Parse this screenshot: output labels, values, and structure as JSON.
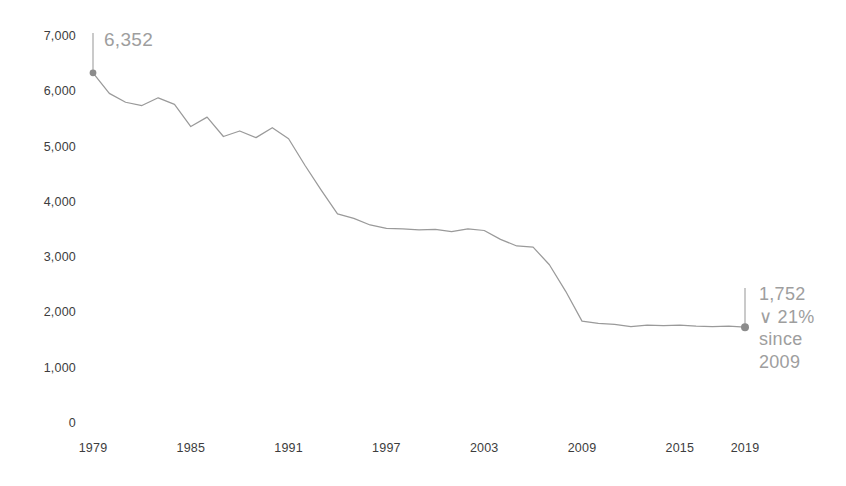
{
  "chart_data": {
    "type": "line",
    "title": "",
    "subtitle": "",
    "xlabel": "",
    "ylabel": "",
    "xlim": [
      1979,
      2019
    ],
    "ylim": [
      0,
      7000
    ],
    "grid": false,
    "legend": false,
    "legend_position": "none",
    "line_color": "#9a9a9a",
    "marker_color": "#8c8c8c",
    "annotation_color": "#9e9e9e",
    "tick_color": "#3d3d3d",
    "x_ticks": [
      "1979",
      "1985",
      "1991",
      "1997",
      "2003",
      "2009",
      "2015",
      "2019"
    ],
    "x_tick_values": [
      1979,
      1985,
      1991,
      1997,
      2003,
      2009,
      2015,
      2019
    ],
    "y_ticks": [
      "0",
      "1,000",
      "2,000",
      "3,000",
      "4,000",
      "5,000",
      "6,000",
      "7,000"
    ],
    "y_tick_values": [
      0,
      1000,
      2000,
      3000,
      4000,
      5000,
      6000,
      7000
    ],
    "x": [
      1979,
      1980,
      1981,
      1982,
      1983,
      1984,
      1985,
      1986,
      1987,
      1988,
      1989,
      1990,
      1991,
      1992,
      1993,
      1994,
      1995,
      1996,
      1997,
      1998,
      1999,
      2000,
      2001,
      2002,
      2003,
      2004,
      2005,
      2006,
      2007,
      2008,
      2009,
      2010,
      2011,
      2012,
      2013,
      2014,
      2015,
      2016,
      2017,
      2018,
      2019
    ],
    "values": [
      6352,
      5980,
      5820,
      5760,
      5900,
      5780,
      5380,
      5550,
      5200,
      5300,
      5180,
      5360,
      5160,
      4680,
      4230,
      3800,
      3720,
      3600,
      3540,
      3530,
      3510,
      3520,
      3480,
      3530,
      3500,
      3340,
      3220,
      3200,
      2880,
      2400,
      1860,
      1820,
      1800,
      1760,
      1790,
      1780,
      1790,
      1770,
      1760,
      1770,
      1752
    ],
    "annotations": [
      {
        "name": "start-value",
        "label": "6,352",
        "x": 1979,
        "value": 6352,
        "marker": true,
        "leader": "up"
      },
      {
        "name": "end-value",
        "lines": [
          "1,752",
          "∨ 21%",
          "since",
          "2009"
        ],
        "label": "1,752",
        "change_pct": "21%",
        "change_direction": "down",
        "since_label": "since",
        "since_year": "2009",
        "x": 2019,
        "value": 1752,
        "marker": true,
        "leader": "up"
      }
    ]
  },
  "axes": {
    "y_labels": [
      "7,000",
      "6,000",
      "5,000",
      "4,000",
      "3,000",
      "2,000",
      "1,000",
      "0"
    ],
    "x_labels": [
      "1979",
      "1985",
      "1991",
      "1997",
      "2003",
      "2009",
      "2015",
      "2019"
    ]
  },
  "annotations": {
    "start": {
      "value_label": "6,352"
    },
    "end": {
      "value_label": "1,752",
      "change_label": "∨ 21%",
      "since_label": "since",
      "since_year": "2009"
    }
  }
}
